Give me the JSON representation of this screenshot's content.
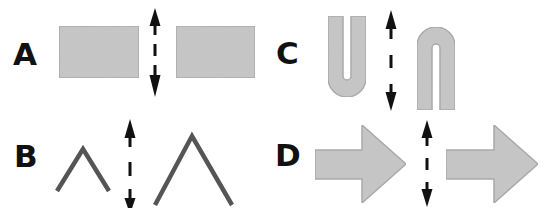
{
  "figure": {
    "panels": [
      {
        "id": "A",
        "label": "A",
        "description": "Two identical gray rectangles separated by a dashed double-headed vertical arrow",
        "shape": "rectangle",
        "left_item": "rectangle",
        "right_item": "rectangle"
      },
      {
        "id": "B",
        "label": "B",
        "description": "Small chevron on the left and larger chevron on the right separated by a dashed double-headed vertical arrow",
        "shape": "chevron",
        "left_item": "small-chevron",
        "right_item": "large-chevron"
      },
      {
        "id": "C",
        "label": "C",
        "description": "U-shaped outline on the left and an inverted U (n) shape on the right separated by a dashed double-headed vertical arrow",
        "shape": "u-shape",
        "left_item": "u-shape",
        "right_item": "inverted-u-shape"
      },
      {
        "id": "D",
        "label": "D",
        "description": "Two identical right-pointing block arrows separated by a dashed double-headed vertical arrow",
        "shape": "block-arrow",
        "left_item": "right-arrow",
        "right_item": "right-arrow"
      }
    ],
    "separator": "dashed-double-headed-vertical-arrow",
    "colors": {
      "shape_fill": "#c4c4c4",
      "shape_stroke": "#a8a8a8",
      "chevron_stroke": "#555555",
      "arrow": "#111111",
      "label": "#111111",
      "background": "#ffffff"
    }
  }
}
